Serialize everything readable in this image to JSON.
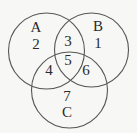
{
  "diagram": {
    "type": "venn",
    "sets": [
      {
        "name": "A",
        "label": "A",
        "cx": 46.5,
        "cy": 51,
        "r": 38
      },
      {
        "name": "B",
        "label": "B",
        "cx": 91.5,
        "cy": 50,
        "r": 37
      },
      {
        "name": "C",
        "label": "C",
        "cx": 69.5,
        "cy": 90,
        "r": 38
      }
    ],
    "regions": {
      "A_only": "2",
      "B_only": "1",
      "C_only": "7",
      "A_and_B": "3",
      "A_and_C": "4",
      "B_and_C": "6",
      "A_and_B_and_C": "5"
    },
    "colors": {
      "stroke": "#555555",
      "text": "#2a2a2a",
      "background": "#f7f7f5"
    }
  }
}
